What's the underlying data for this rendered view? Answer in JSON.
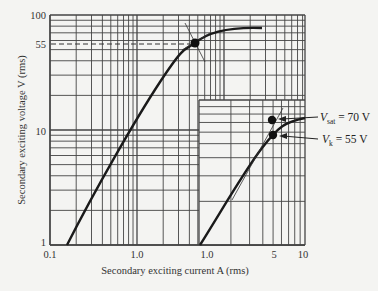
{
  "chart_data": [
    {
      "type": "line",
      "title": "",
      "scale": "log-log",
      "xlabel": "Secondary exciting current A (rms)",
      "ylabel": "Secondary exciting  voltage V (rms)",
      "x_ticks": [
        "0.1",
        "1.0"
      ],
      "y_ticks": [
        "1",
        "10",
        "55",
        "100"
      ],
      "xlim": [
        0.1,
        8
      ],
      "ylim": [
        1,
        100
      ],
      "grid": true,
      "series": [
        {
          "name": "Excitation curve",
          "x": [
            0.15,
            0.3,
            0.5,
            0.8,
            1.3,
            2.0,
            3.5,
            6.0
          ],
          "y": [
            1,
            2.3,
            5,
            12,
            32,
            55,
            70,
            72
          ]
        }
      ],
      "annotations": [
        {
          "type": "hline-dashed",
          "y": 55,
          "label": "55"
        },
        {
          "type": "point",
          "label": "knee point",
          "x": 2.0,
          "y": 55
        }
      ]
    },
    {
      "type": "line",
      "title": "Inset (detail)",
      "scale": "log-log",
      "x_ticks": [
        "1.0",
        "5",
        "10"
      ],
      "xlim": [
        1,
        10
      ],
      "grid": true,
      "series": [
        {
          "name": "Excitation curve (detail)",
          "x": [
            1.0,
            2.0,
            3.0,
            4.0,
            5.0,
            7.0,
            10.0
          ],
          "y": [
            1,
            2,
            3.2,
            4.5,
            5.5,
            6.3,
            6.8
          ]
        }
      ],
      "annotations": [
        {
          "type": "point",
          "label": "V_sat = 70 V",
          "value": 70,
          "unit": "V"
        },
        {
          "type": "point",
          "label": "V_k = 55 V",
          "value": 55,
          "unit": "V"
        }
      ]
    }
  ],
  "labels": {
    "ylabel": "Secondary exciting  voltage V (rms)",
    "xlabel": "Secondary exciting current A (rms)",
    "y_ticks": {
      "t100": "100",
      "t55": "55",
      "t10": "10",
      "t1": "1"
    },
    "x_ticks_main": {
      "t01": "0.1",
      "t1": "1.0"
    },
    "x_ticks_inset": {
      "t1": "1.0",
      "t5": "5",
      "t10": "10"
    },
    "vsat": {
      "sym": "V",
      "sub": "sat",
      "rest": " = 70 V"
    },
    "vk": {
      "sym": "V",
      "sub": "k",
      "rest": " = 55 V"
    }
  },
  "colors": {
    "grid": "#444444",
    "curve": "#1a1a1a",
    "background": "#f4f4f2"
  }
}
